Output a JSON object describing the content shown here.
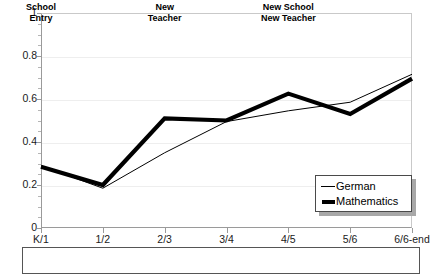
{
  "chart_data": {
    "type": "line",
    "title": "",
    "xlabel": "",
    "ylabel": "",
    "ylim": [
      0,
      1
    ],
    "grid": true,
    "legend_position": "bottom-right-inside",
    "categories": [
      "K/1",
      "1/2",
      "2/3",
      "3/4",
      "4/5",
      "5/6",
      "6/6-end"
    ],
    "series": [
      {
        "name": "German",
        "style": "thin-line",
        "color": "#000000",
        "values": [
          0.29,
          0.185,
          0.35,
          0.495,
          0.545,
          0.585,
          0.715
        ]
      },
      {
        "name": "Mathematics",
        "style": "thick-line",
        "color": "#000000",
        "values": [
          0.285,
          0.2,
          0.51,
          0.5,
          0.625,
          0.53,
          0.695
        ]
      }
    ],
    "y_ticks": [
      "0",
      "0.2",
      "0.4",
      "0.6",
      "0.8",
      "1"
    ],
    "y_tick_values": [
      0,
      0.2,
      0.4,
      0.6,
      0.8,
      1
    ]
  },
  "axes": {
    "y_labels": [
      "1",
      "0.8",
      "0.6",
      "0.4",
      "0.2",
      "0"
    ],
    "x_labels": [
      "K/1",
      "1/2",
      "2/3",
      "3/4",
      "4/5",
      "5/6",
      "6/6-end"
    ]
  },
  "legend": {
    "entries": [
      {
        "label": "German",
        "swatch": "thin-line-swatch"
      },
      {
        "label": "Mathematics",
        "swatch": "thick-line-swatch"
      }
    ]
  },
  "phase_bar": {
    "cells": [
      {
        "line1": "School",
        "line2": "Entry",
        "center_category_index": 0
      },
      {
        "line1": "New",
        "line2": "Teacher",
        "center_category_index": 2
      },
      {
        "line1": "New School",
        "line2": "New Teacher",
        "center_category_index": 4
      }
    ]
  },
  "title_remnant": {
    "text": ""
  }
}
